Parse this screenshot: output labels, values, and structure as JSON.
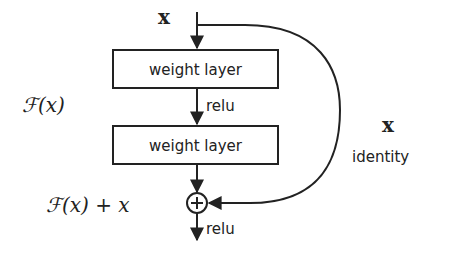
{
  "diagram": {
    "type": "residual-block",
    "input_label": "x",
    "layers": [
      {
        "label": "weight layer"
      },
      {
        "label": "weight layer"
      }
    ],
    "activations": {
      "between_layers": "relu",
      "output": "relu"
    },
    "residual_function_label": "ℱ(x)",
    "sum_label": "ℱ(x) + x",
    "shortcut": {
      "label_var": "x",
      "label_text": "identity"
    },
    "add_operator": "+",
    "colors": {
      "stroke": "#222222",
      "background": "#ffffff",
      "text": "#222222"
    }
  }
}
